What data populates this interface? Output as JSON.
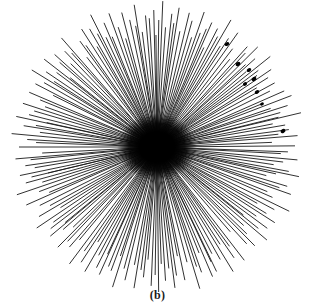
{
  "figure": {
    "caption": "(b)",
    "background_color": "#ffffff",
    "ink_color": "#1a1a1a",
    "core_color": "#000000"
  },
  "chart_data": {
    "type": "scatter",
    "title": "",
    "subtitle": "",
    "xlabel": "",
    "ylabel": "",
    "annotations": [
      "(b)"
    ],
    "legend": [],
    "grid": false,
    "coordinate_system": "polar",
    "center": [
      157,
      147
    ],
    "units": "pixels",
    "ray_count": 208,
    "radius_min": 96,
    "radius_max": 148,
    "radius_mean": 126,
    "core_radius": 34,
    "angle_start_deg": 0,
    "angle_end_deg": 360,
    "xlim": [
      0,
      315
    ],
    "ylim": [
      0,
      308
    ],
    "line_width": 0.9,
    "radii_by_index": [
      138,
      131,
      124,
      141,
      127,
      118,
      134,
      145,
      122,
      113,
      136,
      129,
      142,
      119,
      126,
      147,
      133,
      115,
      128,
      140,
      121,
      137,
      110,
      130,
      144,
      117,
      125,
      139,
      132,
      112,
      143,
      123,
      135,
      116,
      146,
      129,
      120,
      138,
      127,
      141,
      114,
      133,
      126,
      148,
      119,
      136,
      111,
      130,
      142,
      122,
      134,
      117,
      145,
      128,
      139,
      113,
      131,
      124,
      143,
      120,
      137,
      126,
      147,
      115,
      132,
      129,
      140,
      118,
      135,
      123,
      144,
      112,
      138,
      127,
      146,
      121,
      133,
      130,
      141,
      116,
      125,
      139,
      119,
      134,
      128,
      145,
      114,
      137,
      122,
      131,
      143,
      117,
      126,
      148,
      120,
      136,
      129,
      112,
      140,
      124,
      133,
      127,
      142,
      115,
      138,
      121,
      130,
      146,
      118,
      135,
      123,
      144,
      113,
      132,
      128,
      141,
      119,
      126,
      139,
      116,
      137,
      130,
      147,
      122,
      134,
      125,
      143,
      111,
      129,
      138,
      120,
      133,
      127,
      145,
      114,
      131,
      124,
      140,
      117,
      136,
      128,
      148,
      121,
      135,
      119,
      142,
      126,
      113,
      139,
      130,
      123,
      144,
      116,
      132,
      129,
      137,
      112,
      127,
      146,
      120,
      134,
      125,
      141,
      118,
      138,
      131,
      115,
      143,
      122,
      128,
      136,
      110,
      133,
      126,
      147,
      119,
      130,
      140,
      124,
      114,
      135,
      129,
      142,
      121,
      132,
      117,
      145,
      127,
      123,
      138,
      131,
      116,
      134,
      126,
      139,
      113,
      144,
      120,
      137,
      128,
      125,
      148,
      118,
      130,
      133,
      122,
      141,
      115
    ],
    "tip_markers": [
      {
        "label": "tip-marker-1",
        "x": 227,
        "y": 44,
        "size": 2.4
      },
      {
        "label": "tip-marker-2",
        "x": 238,
        "y": 64,
        "size": 2.6
      },
      {
        "label": "tip-marker-3",
        "x": 249,
        "y": 70,
        "size": 2.4
      },
      {
        "label": "tip-marker-4",
        "x": 254,
        "y": 79,
        "size": 2.6
      },
      {
        "label": "tip-marker-5",
        "x": 245,
        "y": 84,
        "size": 2.2
      },
      {
        "label": "tip-marker-6",
        "x": 257,
        "y": 92,
        "size": 2.4
      },
      {
        "label": "tip-marker-7",
        "x": 283,
        "y": 131,
        "size": 2.6
      },
      {
        "label": "tip-marker-8",
        "x": 262,
        "y": 104,
        "size": 2.0
      }
    ]
  }
}
